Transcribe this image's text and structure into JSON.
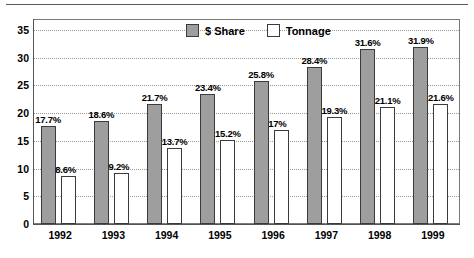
{
  "chart_data": {
    "type": "bar",
    "title": "",
    "xlabel": "",
    "ylabel": "",
    "ylim": [
      0,
      37
    ],
    "yticks": [
      0,
      5,
      10,
      15,
      20,
      25,
      30,
      35
    ],
    "ytick_labels": [
      "0",
      "5",
      "10",
      "15",
      "20",
      "25",
      "30",
      "35"
    ],
    "grid": "horizontal-dotted",
    "legend_position": "top-center",
    "categories": [
      "1992",
      "1993",
      "1994",
      "1995",
      "1996",
      "1997",
      "1998",
      "1999"
    ],
    "series": [
      {
        "name": "$ Share",
        "color": "#9e9e9e",
        "values": [
          17.7,
          18.6,
          21.7,
          23.4,
          25.8,
          28.4,
          31.6,
          31.9
        ],
        "labels": [
          "17.7%",
          "18.6%",
          "21.7%",
          "23.4%",
          "25.8%",
          "28.4%",
          "31.6%",
          "31.9%"
        ]
      },
      {
        "name": "Tonnage",
        "color": "#ffffff",
        "values": [
          8.6,
          9.2,
          13.7,
          15.2,
          17.0,
          19.3,
          21.1,
          21.6
        ],
        "labels": [
          "8.6%",
          "9.2%",
          "13.7%",
          "15.2%",
          "17%",
          "19.3%",
          "21.1%",
          "21.6%"
        ]
      }
    ]
  },
  "legend": {
    "items": [
      {
        "label": "$ Share",
        "swatch": "filled-gray-swatch"
      },
      {
        "label": "Tonnage",
        "swatch": "outlined-white-swatch"
      }
    ]
  },
  "colors": {
    "share_fill": "#9e9e9e",
    "tonnage_fill": "#ffffff",
    "bar_outline": "#3b3b3b",
    "axis": "#555555",
    "grid": "#9a9a9a",
    "frame": "#7a7a7a"
  }
}
